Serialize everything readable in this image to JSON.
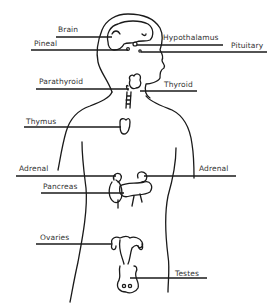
{
  "diagram": {
    "colors": {
      "ink": "#1a1a1a",
      "label": "#333333",
      "background": "#ffffff"
    },
    "labels": [
      {
        "id": "brain",
        "text": "Brain",
        "x": 58,
        "y": 26
      },
      {
        "id": "pineal",
        "text": "Pineal",
        "x": 34,
        "y": 40
      },
      {
        "id": "hypothalamus",
        "text": "Hypothalamus",
        "x": 163,
        "y": 34
      },
      {
        "id": "pituitary",
        "text": "Pituitary",
        "x": 231,
        "y": 42
      },
      {
        "id": "parathyroid",
        "text": "Parathyroid",
        "x": 39,
        "y": 78
      },
      {
        "id": "thyroid",
        "text": "Thyroid",
        "x": 164,
        "y": 81
      },
      {
        "id": "thymus",
        "text": "Thymus",
        "x": 26,
        "y": 118
      },
      {
        "id": "adrenal-left",
        "text": "Adrenal",
        "x": 19,
        "y": 165
      },
      {
        "id": "adrenal-right",
        "text": "Adrenal",
        "x": 199,
        "y": 165
      },
      {
        "id": "pancreas",
        "text": "Pancreas",
        "x": 43,
        "y": 183
      },
      {
        "id": "ovaries",
        "text": "Ovaries",
        "x": 40,
        "y": 234
      },
      {
        "id": "testes",
        "text": "Testes",
        "x": 175,
        "y": 270
      }
    ]
  }
}
